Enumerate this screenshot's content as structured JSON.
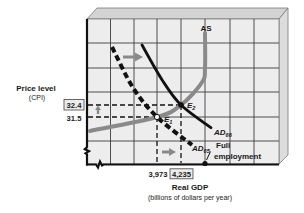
{
  "chart_data": {
    "type": "line",
    "title": "",
    "xlabel": "Real GDP",
    "xlabel_note": "(billions of dollars per year)",
    "ylabel": "Price level",
    "ylabel_note": "(CPI)",
    "grid": true,
    "axis_breaks": true,
    "x_ticks": [
      {
        "value": 3973,
        "label": "3,973",
        "boxed": false
      },
      {
        "value": 4235,
        "label": "4,235",
        "boxed": true
      }
    ],
    "y_ticks": [
      {
        "value": 32.4,
        "label": "32.4",
        "boxed": true
      },
      {
        "value": 31.5,
        "label": "31.5",
        "boxed": false
      }
    ],
    "series": [
      {
        "name": "AS",
        "label": "AS",
        "subscript": "",
        "style": "solid",
        "color": "#8a8a8a",
        "points": [
          [
            3242,
            30.45
          ],
          [
            3973,
            31.5
          ],
          [
            4235,
            32.4
          ],
          [
            4464,
            34.1
          ],
          [
            4497,
            35.2
          ],
          [
            4497,
            37.8
          ]
        ]
      },
      {
        "name": "AD65",
        "label": "AD",
        "subscript": "65",
        "style": "dashed",
        "color": "#111111",
        "points": [
          [
            3482,
            36.75
          ],
          [
            3711,
            33.7
          ],
          [
            3973,
            31.5
          ],
          [
            4355,
            29.4
          ]
        ]
      },
      {
        "name": "AD66",
        "label": "AD",
        "subscript": "66",
        "style": "solid",
        "color": "#111111",
        "points": [
          [
            3809,
            36.9
          ],
          [
            4028,
            34.3
          ],
          [
            4235,
            32.4
          ],
          [
            4563,
            30.7
          ]
        ]
      }
    ],
    "equilibria": [
      {
        "label": "E",
        "subscript": "1",
        "x": 3973,
        "y": 31.5
      },
      {
        "label": "E",
        "subscript": "2",
        "x": 4235,
        "y": 32.4
      }
    ],
    "annotations": [
      {
        "text_line1": "Full",
        "text_line2": "employment",
        "x": 4497
      }
    ],
    "shift_arrows": [
      "AD shifts right",
      "price level rises",
      "real GDP rises"
    ]
  }
}
